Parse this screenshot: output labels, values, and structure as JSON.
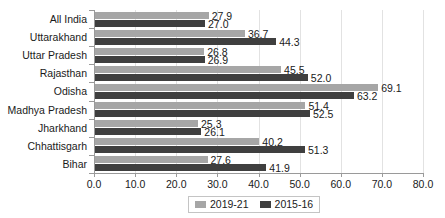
{
  "chart_data": {
    "type": "bar",
    "orientation": "horizontal",
    "title": "",
    "subtitle": "",
    "xlabel": "",
    "ylabel": "",
    "xlim": [
      0.0,
      80.0
    ],
    "xticks": [
      "0.0",
      "10.0",
      "20.0",
      "30.0",
      "40.0",
      "50.0",
      "60.0",
      "70.0",
      "80.0"
    ],
    "xtick_values": [
      0,
      10,
      20,
      30,
      40,
      50,
      60,
      70,
      80
    ],
    "grid": true,
    "grid_axis": "x",
    "legend_position": "bottom-center",
    "categories": [
      "All India",
      "Uttarakhand",
      "Uttar Pradesh",
      "Rajasthan",
      "Odisha",
      "Madhya Pradesh",
      "Jharkhand",
      "Chhattisgarh",
      "Bihar"
    ],
    "series": [
      {
        "name": "2019-21",
        "color": "#a6a6a6",
        "values": [
          27.9,
          36.7,
          26.8,
          45.5,
          69.1,
          51.4,
          25.3,
          40.2,
          27.6
        ],
        "labels": [
          "27.9",
          "36.7",
          "26.8",
          "45.5",
          "69.1",
          "51.4",
          "25.3",
          "40.2",
          "27.6"
        ]
      },
      {
        "name": "2015-16",
        "color": "#3f3f3f",
        "values": [
          27.0,
          44.3,
          26.9,
          52.0,
          63.2,
          52.5,
          26.1,
          51.3,
          41.9
        ],
        "labels": [
          "27.0",
          "44.3",
          "26.9",
          "52.0",
          "63.2",
          "52.5",
          "26.1",
          "51.3",
          "41.9"
        ]
      }
    ]
  },
  "legend": {
    "entries": [
      {
        "label": "2019-21",
        "color": "#a6a6a6"
      },
      {
        "label": "2015-16",
        "color": "#3f3f3f"
      }
    ]
  }
}
